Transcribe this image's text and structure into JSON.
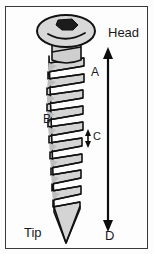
{
  "figure": {
    "background_color": "#fdfdfd",
    "border": {
      "color": "#3a3a3a",
      "width_px": 1,
      "x": 5,
      "y": 6,
      "w": 143,
      "h": 243
    },
    "labels": {
      "head": "Head",
      "tip": "Tip",
      "a": "A",
      "b": "B",
      "c": "C",
      "d": "D"
    },
    "colors": {
      "screw_fill": "#d0d0d0",
      "screw_fill_light": "#e2e2e2",
      "screw_outline": "#111111",
      "socket_fill": "#1c1c1c",
      "arrow_color": "#0d0d0d",
      "text_color": "#1a1a1a"
    },
    "parts": {
      "head_label_name": "screw head",
      "socket_label_name": "hex drive socket",
      "shank_label_name": "threaded shank",
      "tip_label_name": "screw tip"
    },
    "measurements": {
      "a": {
        "code": "A",
        "meaning": "thread outer diameter region"
      },
      "b": {
        "code": "B",
        "meaning": "thread crest / flank"
      },
      "c": {
        "code": "C",
        "meaning": "thread pitch",
        "arrow": "double-headed vertical",
        "arrow_x": 88,
        "arrow_y_top": 131,
        "arrow_y_bottom": 146
      },
      "d": {
        "code": "D",
        "meaning": "total screw length",
        "arrow": "double-headed vertical",
        "arrow_x": 108,
        "arrow_y_top": 50,
        "arrow_y_bottom": 229
      }
    },
    "thread": {
      "turns": 15,
      "top_y": 58,
      "bottom_y": 215,
      "axis_x": 66,
      "half_width_top": 19,
      "half_width_bottom": 15
    }
  }
}
